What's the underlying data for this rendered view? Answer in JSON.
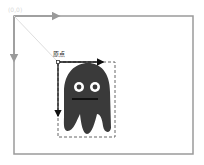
{
  "diagram": {
    "outer_frame": {
      "origin_label": "(0,0)",
      "stroke": "#9a9a9a",
      "x": 14,
      "y": 16,
      "width": 179,
      "height": 138
    },
    "diagonal_line": {
      "from": [
        14,
        16
      ],
      "to": [
        57,
        61
      ],
      "stroke": "#dddddd"
    },
    "element": {
      "origin_label": "原点",
      "bounding_box": {
        "x": 58,
        "y": 62,
        "width": 57,
        "height": 75,
        "style": "dashed"
      },
      "x_axis_arrow": {
        "from": [
          58,
          62
        ],
        "to": [
          102,
          62
        ]
      },
      "y_axis_arrow": {
        "from": [
          58,
          62
        ],
        "to": [
          58,
          115
        ]
      },
      "shape": "ghost-character",
      "fill": "#3a3a3a"
    }
  }
}
